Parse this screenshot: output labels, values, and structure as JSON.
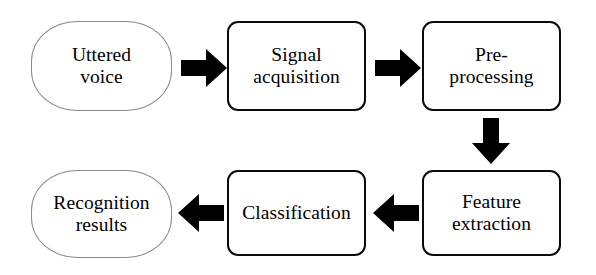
{
  "diagram": {
    "title": "Speech recognition pipeline flowchart",
    "background_color": "#ffffff",
    "text_color": "#000000",
    "process_border_color": "#0b0b0b",
    "terminator_border_color": "#8a8a8a",
    "arrow_color": "#000000",
    "nodes": [
      {
        "id": "uttered-voice",
        "label": "Uttered\nvoice",
        "shape": "terminator",
        "row": 1,
        "order": 1
      },
      {
        "id": "signal-acquisition",
        "label": "Signal\nacquisition",
        "shape": "process",
        "row": 1,
        "order": 2
      },
      {
        "id": "pre-processing",
        "label": "Pre-\nprocessing",
        "shape": "process",
        "row": 1,
        "order": 3
      },
      {
        "id": "feature-extraction",
        "label": "Feature\nextraction",
        "shape": "process",
        "row": 2,
        "order": 4
      },
      {
        "id": "classification",
        "label": "Classification",
        "shape": "process",
        "row": 2,
        "order": 5
      },
      {
        "id": "recognition-results",
        "label": "Recognition\nresults",
        "shape": "terminator",
        "row": 2,
        "order": 6
      }
    ],
    "arrows": [
      {
        "id": "arrow-1",
        "from": "uttered-voice",
        "to": "signal-acquisition",
        "direction": "right"
      },
      {
        "id": "arrow-2",
        "from": "signal-acquisition",
        "to": "pre-processing",
        "direction": "right"
      },
      {
        "id": "arrow-3",
        "from": "pre-processing",
        "to": "feature-extraction",
        "direction": "down"
      },
      {
        "id": "arrow-4",
        "from": "feature-extraction",
        "to": "classification",
        "direction": "left"
      },
      {
        "id": "arrow-5",
        "from": "classification",
        "to": "recognition-results",
        "direction": "left"
      }
    ]
  }
}
